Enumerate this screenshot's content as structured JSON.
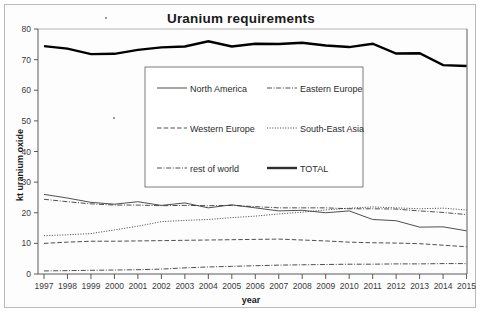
{
  "chart_data": {
    "type": "line",
    "title": "Uranium requirements",
    "xlabel": "year",
    "ylabel": "kt uranium oxide",
    "grid": false,
    "legend_position": "center",
    "xlim": [
      1997,
      2015
    ],
    "ylim": [
      0,
      80
    ],
    "ytick_step": 10,
    "yticks": [
      0,
      10,
      20,
      30,
      40,
      50,
      60,
      70,
      80
    ],
    "categories": [
      "1997",
      "1998",
      "1999",
      "2000",
      "2001",
      "2002",
      "2003",
      "2004",
      "2005",
      "2006",
      "2007",
      "2008",
      "2009",
      "2010",
      "2011",
      "2012",
      "2013",
      "2014",
      "2015"
    ],
    "series": [
      {
        "name": "North America",
        "style": "solid",
        "width": "thin",
        "values": [
          26.0,
          24.8,
          23.4,
          22.8,
          23.6,
          22.4,
          23.2,
          21.6,
          22.6,
          21.6,
          20.6,
          20.8,
          20.0,
          20.6,
          17.8,
          17.4,
          15.3,
          15.4,
          14.1
        ]
      },
      {
        "name": "Eastern Europe",
        "style": "dash-dot",
        "width": "thin",
        "values": [
          24.4,
          23.6,
          22.9,
          22.5,
          22.5,
          22.3,
          22.4,
          22.3,
          22.4,
          22.0,
          21.6,
          21.6,
          21.6,
          21.3,
          21.3,
          21.2,
          20.6,
          20.1,
          19.4
        ]
      },
      {
        "name": "Western Europe",
        "style": "dashed",
        "width": "thin",
        "values": [
          10.0,
          10.4,
          10.7,
          10.7,
          10.8,
          10.9,
          11.0,
          11.1,
          11.2,
          11.3,
          11.4,
          11.1,
          10.8,
          10.4,
          10.2,
          10.1,
          9.9,
          9.4,
          8.9
        ]
      },
      {
        "name": "South-East Asia",
        "style": "dotted",
        "width": "thin",
        "values": [
          12.5,
          12.8,
          13.2,
          14.4,
          15.6,
          17.1,
          17.5,
          17.8,
          18.4,
          18.9,
          19.6,
          20.2,
          20.9,
          21.5,
          21.9,
          21.6,
          21.3,
          21.5,
          20.9
        ]
      },
      {
        "name": "rest of world",
        "style": "dash-dot",
        "width": "thin",
        "values": [
          1.0,
          1.1,
          1.2,
          1.3,
          1.4,
          1.6,
          2.0,
          2.3,
          2.5,
          2.7,
          2.9,
          3.0,
          3.1,
          3.2,
          3.2,
          3.3,
          3.3,
          3.4,
          3.4
        ]
      },
      {
        "name": "TOTAL",
        "style": "solid",
        "width": "thick",
        "values": [
          74.4,
          73.6,
          71.8,
          71.9,
          73.2,
          74.0,
          74.3,
          76.0,
          74.3,
          75.2,
          75.1,
          75.5,
          74.6,
          74.1,
          75.2,
          72.0,
          72.1,
          68.2,
          67.9
        ]
      }
    ],
    "legend_entries": [
      {
        "label": "North America",
        "style": "solid"
      },
      {
        "label": "Eastern Europe",
        "style": "dash-dot"
      },
      {
        "label": "Western Europe",
        "style": "dashed"
      },
      {
        "label": "South-East Asia",
        "style": "dotted"
      },
      {
        "label": "rest of world",
        "style": "dash-dot"
      },
      {
        "label": "TOTAL",
        "style": "solid-thick"
      }
    ]
  }
}
